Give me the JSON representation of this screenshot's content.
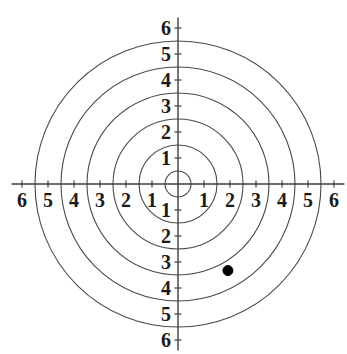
{
  "figure": {
    "kind": "polar-grid",
    "title": "",
    "background_color": "#ffffff",
    "axis_color": "#3b3b3b",
    "circle_color": "#4a4a4a",
    "point_color": "#000000",
    "label_color": "#1b1b1b",
    "width": 347,
    "height": 354
  },
  "axes": {
    "origin_x": 178,
    "origin_y": 184,
    "unit_px": 26,
    "x_axis_label": "",
    "y_axis_label": "",
    "x_labels_right": [
      "1",
      "2",
      "3",
      "4",
      "5",
      "6"
    ],
    "x_labels_left": [
      "1",
      "2",
      "3",
      "4",
      "5",
      "6"
    ],
    "y_labels_up": [
      "1",
      "2",
      "3",
      "4",
      "5",
      "6"
    ],
    "y_labels_down": [
      "1",
      "2",
      "3",
      "4",
      "5",
      "6"
    ],
    "xlim": [
      -6.4,
      6.4
    ],
    "ylim": [
      -6.4,
      6.4
    ]
  },
  "chart_data": {
    "type": "scatter",
    "coordinate_system": "polar",
    "title": "",
    "xlabel": "",
    "ylabel": "",
    "xlim": [
      -6.4,
      6.4
    ],
    "ylim": [
      -6.4,
      6.4
    ],
    "grid": true,
    "legend": null,
    "x_ticks": [
      -6,
      -5,
      -4,
      -3,
      -2,
      -1,
      1,
      2,
      3,
      4,
      5,
      6
    ],
    "x_tick_labels": [
      "6",
      "5",
      "4",
      "3",
      "2",
      "1",
      "1",
      "2",
      "3",
      "4",
      "5",
      "6"
    ],
    "y_ticks": [
      -6,
      -5,
      -4,
      -3,
      -2,
      -1,
      1,
      2,
      3,
      4,
      5,
      6
    ],
    "y_tick_labels": [
      "6",
      "5",
      "4",
      "3",
      "2",
      "1",
      "1",
      "2",
      "3",
      "4",
      "5",
      "6"
    ],
    "grid_circle_radii": [
      0.5,
      1.5,
      2.5,
      3.5,
      4.5,
      5.5
    ],
    "points": [
      {
        "label": "",
        "r": 3.85,
        "theta_deg": -60,
        "x": 1.92,
        "y": -3.33,
        "marker": "filled-circle",
        "marker_radius_px": 5,
        "color": "#000000"
      }
    ]
  },
  "tick_marks": {
    "length_px": 7,
    "visible": true
  }
}
